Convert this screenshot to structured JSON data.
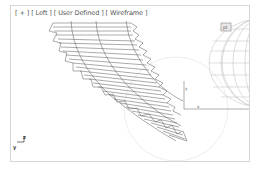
{
  "viewport": {
    "labels": [
      "[ + ]",
      "[ Left ]",
      "[ User Defined ]",
      "[ Wireframe ]"
    ],
    "gizmo": {
      "z": "z",
      "y": "y"
    },
    "object_tag": "pt",
    "gear_color": "#555555",
    "sphere_color": "#bdbdbd",
    "border_color": "#d6d6d6"
  }
}
